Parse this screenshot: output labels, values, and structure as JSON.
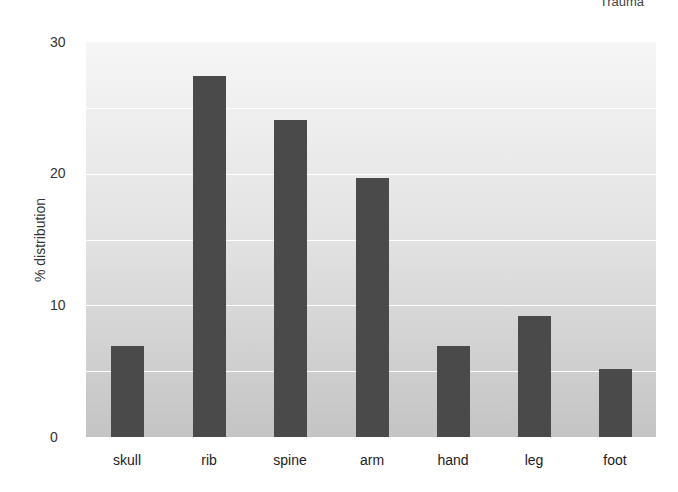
{
  "chart_data": {
    "type": "bar",
    "title": "",
    "corner_label": "Trauma",
    "xlabel": "",
    "ylabel": "% distribution",
    "ylim": [
      0,
      30
    ],
    "yticks": [
      "0",
      "10",
      "20",
      "30"
    ],
    "gridlines": [
      5,
      10,
      15,
      20,
      25
    ],
    "grid": true,
    "categories": [
      "skull",
      "rib",
      "spine",
      "arm",
      "hand",
      "leg",
      "foot"
    ],
    "values": [
      6.9,
      27.4,
      24.1,
      19.7,
      6.9,
      9.2,
      5.2
    ],
    "colors": {
      "bar": "#4a4a4a",
      "grid": "#ffffff",
      "background_top": "#f6f6f6",
      "background_bottom": "#c4c4c4"
    }
  }
}
